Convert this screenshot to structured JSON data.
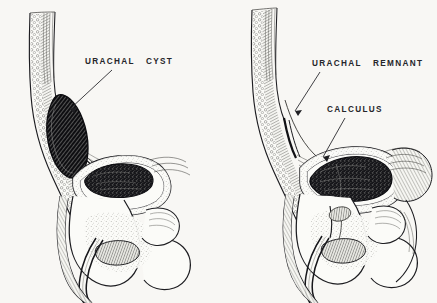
{
  "figure": {
    "background_color": "#f8f7f4",
    "ink_color": "#1a1a1e",
    "label_color": "#25252a",
    "style": "pen-and-ink medical engraving, stipple and hatch shading"
  },
  "panels": [
    {
      "id": "left-panel",
      "name": "urachal-cyst-panel",
      "labels": [
        {
          "id": "urachal-cyst",
          "word1": "URACHAL",
          "word2": "CYST",
          "text": "URACHAL   CYST",
          "x": 85,
          "y": 58,
          "leader_from": [
            112,
            70
          ],
          "leader_to": [
            68,
            110
          ]
        }
      ],
      "structures": [
        "anterior abdominal wall with fat and muscle striations",
        "urachal cyst, dark cross-hatched elongated mass",
        "urinary bladder with dark irregular intraluminal mass",
        "pubic symphysis",
        "prostate",
        "urethra",
        "rectum",
        "sacrum"
      ]
    },
    {
      "id": "right-panel",
      "name": "urachal-remnant-calculus-panel",
      "labels": [
        {
          "id": "urachal-remnant",
          "word1": "URACHAL",
          "word2": "REMNANT",
          "text": "URACHAL   REMNANT",
          "x": 312,
          "y": 60,
          "leader_from": [
            320,
            72
          ],
          "leader_to": [
            294,
            112
          ]
        },
        {
          "id": "calculus",
          "word1": "CALCULUS",
          "word2": "",
          "text": "CALCULUS",
          "x": 327,
          "y": 106,
          "leader_from": [
            345,
            118
          ],
          "leader_to": [
            322,
            158
          ]
        }
      ],
      "structures": [
        "anterior abdominal wall with fat and muscle striations",
        "urachal remnant cord running to bladder dome",
        "urinary bladder containing large dark calculus",
        "pubic symphysis",
        "prostate",
        "urethra",
        "rectum",
        "sacrum"
      ]
    }
  ]
}
